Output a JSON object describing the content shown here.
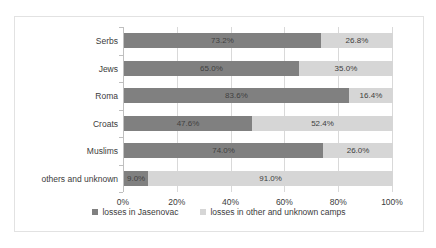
{
  "chart_data": {
    "type": "bar",
    "subtype": "stacked-bar-100-horizontal",
    "orientation": "horizontal",
    "title": "",
    "xlabel": "",
    "ylabel": "",
    "xlim": [
      0,
      100
    ],
    "xticks": [
      "0%",
      "20%",
      "40%",
      "60%",
      "80%",
      "100%"
    ],
    "xtick_values": [
      0,
      20,
      40,
      60,
      80,
      100
    ],
    "grid": true,
    "legend_position": "bottom",
    "categories": [
      "Serbs",
      "Jews",
      "Roma",
      "Croats",
      "Muslims",
      "others and unknown"
    ],
    "series": [
      {
        "name": "losses in Jasenovac",
        "color": "#808080",
        "values": [
          73.2,
          65.0,
          83.6,
          47.6,
          74.0,
          9.0
        ],
        "labels": [
          "73.2%",
          "65.0%",
          "83.6%",
          "47.6%",
          "74.0%",
          "9.0%"
        ]
      },
      {
        "name": "losses in other and unknown camps",
        "color": "#d6d6d6",
        "values": [
          26.8,
          35.0,
          16.4,
          52.4,
          26.0,
          91.0
        ],
        "labels": [
          "26.8%",
          "35.0%",
          "16.4%",
          "52.4%",
          "26.0%",
          "91.0%"
        ]
      }
    ]
  },
  "legend": {
    "items": [
      {
        "label": "losses in Jasenovac"
      },
      {
        "label": "losses in other and unknown camps"
      }
    ]
  }
}
